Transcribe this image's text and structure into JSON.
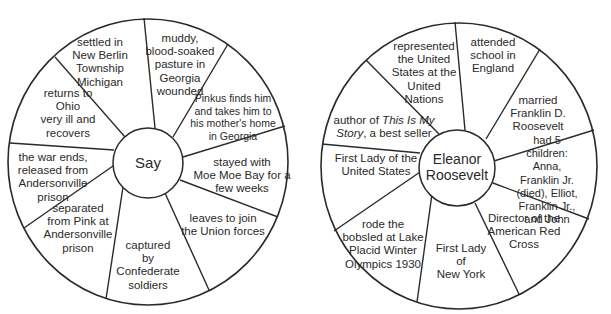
{
  "diagrams": [
    {
      "id": "say",
      "center_label": "Say",
      "segments": [
        "settled in\nNew Berlin\nTownship\nMichigan",
        "muddy,\nblood-soaked\npasture in\nGeorgia\nwounded",
        "Pinkus finds him\nand takes him to\nhis mother's home\nin Georgia",
        "stayed with\nMoe Moe Bay for a\nfew weeks",
        "leaves to join\nthe Union forces",
        "captured\nby\nConfederate\nsoldiers",
        "separated\nfrom Pink at\nAndersonville\nprison",
        "the war ends,\nreleased from\nAndersonville\nprison",
        "returns  to\nOhio\nvery ill and\nrecovers"
      ]
    },
    {
      "id": "eleanor-roosevelt",
      "center_label": "Eleanor\nRoosevelt",
      "segments": [
        "represented\nthe United\nStates at the\nUnited\nNations",
        "attended\nschool in\nEngland",
        "married\nFranklin D.\nRoosevelt",
        "had 5\nchildren: Anna,\nFranklin Jr. (died), Elliot,\nFranklin Jr., and John",
        "Director of the\nAmerican Red\nCross",
        "First Lady\nof\nNew York",
        "rode the\nbobsled at Lake\nPlacid Winter\nOlympics 1930",
        "First Lady of the\nUnited States",
        "author of This Is My\nStory, a best seller"
      ],
      "italic_phrases": [
        "This Is My",
        "Story"
      ]
    }
  ],
  "colors": {
    "stroke": "#2a2a2a",
    "text": "#2a2a2a",
    "background": "#ffffff"
  }
}
